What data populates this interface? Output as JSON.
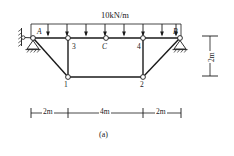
{
  "figure": {
    "caption": "(a)",
    "type": "truss-structural-diagram"
  },
  "load": {
    "label": "10kN/m",
    "direction": "downward",
    "arrow_count": 8,
    "distribution": "uniformly-distributed"
  },
  "nodes": {
    "support_left": "A",
    "support_right": "B",
    "midspan": "C",
    "top_left_panel": "3",
    "top_right_panel": "4",
    "bottom_left": "1",
    "bottom_right": "2"
  },
  "dimensions": {
    "span_left": "2m",
    "span_middle": "4m",
    "span_right": "2m",
    "height": "2m"
  },
  "colors": {
    "line": "#1a1a1a",
    "background": "#ffffff",
    "node_fill": "#ffffff"
  }
}
